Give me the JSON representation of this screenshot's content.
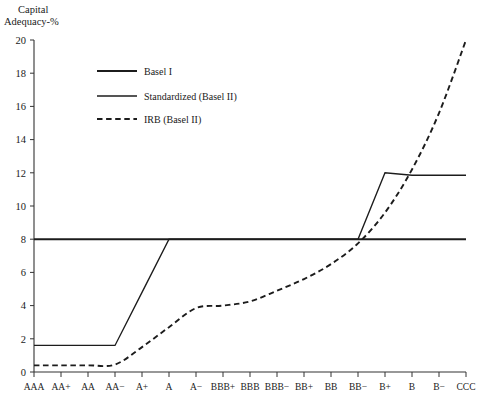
{
  "chart_data": {
    "type": "line",
    "title": "",
    "ylabel": "Capital Adequacy-%",
    "ylabel_line1": "Capital",
    "ylabel_line2": "Adequacy-%",
    "xlabel": "",
    "grid": false,
    "legend_position": "upper-left",
    "ylim": [
      0,
      20
    ],
    "yticks": [
      0,
      2,
      4,
      6,
      8,
      10,
      12,
      14,
      16,
      18,
      20
    ],
    "ytick_labels": [
      "0",
      "2",
      "4",
      "6",
      "8",
      "10",
      "12",
      "14",
      "16",
      "18",
      "20"
    ],
    "categories": [
      "AAA",
      "AA+",
      "AA",
      "AA−",
      "A+",
      "A",
      "A−",
      "BBB+",
      "BBB",
      "BBB−",
      "BB+",
      "BB",
      "BB−",
      "B+",
      "B",
      "B−",
      "CCC"
    ],
    "series": [
      {
        "name": "Basel I",
        "style": "solid-thick",
        "values": [
          8.0,
          8.0,
          8.0,
          8.0,
          8.0,
          8.0,
          8.0,
          8.0,
          8.0,
          8.0,
          8.0,
          8.0,
          8.0,
          8.0,
          8.0,
          8.0,
          8.0
        ]
      },
      {
        "name": "Standardized (Basel II)",
        "style": "solid-thin",
        "values": [
          1.6,
          1.6,
          1.6,
          1.6,
          4.8,
          8.0,
          8.0,
          8.0,
          8.0,
          8.0,
          8.0,
          8.0,
          8.0,
          12.0,
          11.85,
          11.85,
          11.85
        ]
      },
      {
        "name": "IRB (Basel II)",
        "style": "dashed",
        "values": [
          0.4,
          0.4,
          0.4,
          0.45,
          1.5,
          2.7,
          3.85,
          4.0,
          4.25,
          4.9,
          5.6,
          6.5,
          7.75,
          9.6,
          12.2,
          15.6,
          20.0
        ]
      }
    ]
  },
  "legend": {
    "items": [
      {
        "label": "Basel I"
      },
      {
        "label": "Standardized (Basel II)"
      },
      {
        "label": "IRB (Basel II)"
      }
    ]
  }
}
